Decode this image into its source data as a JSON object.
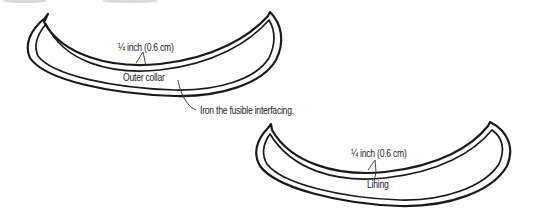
{
  "diagram": {
    "pieces": [
      {
        "id": "outer-collar",
        "name": "Outer collar",
        "seam_allowance_label": "¼ inch (0.6 cm)"
      },
      {
        "id": "lining",
        "name": "Lining",
        "seam_allowance_label": "¼ inch (0.6 cm)"
      }
    ],
    "instruction": "Iron the fusible interfacing.",
    "colors": {
      "line": "#1a1a1a",
      "text": "#1e1e1e",
      "background": "#ffffff"
    }
  }
}
